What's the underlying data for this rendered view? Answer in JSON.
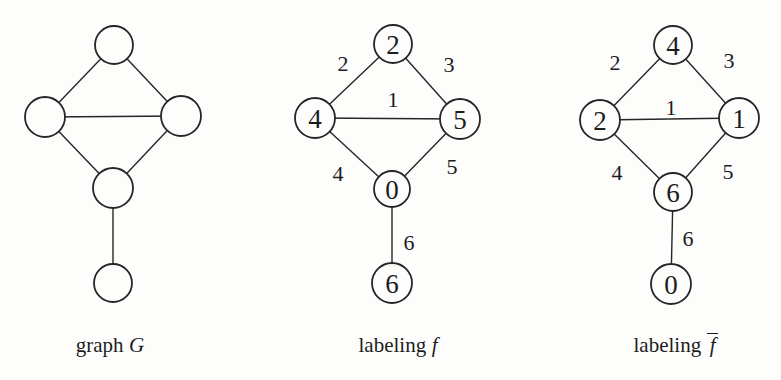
{
  "page": {
    "background": "#fdfdfc",
    "ink": "#262626"
  },
  "diagrams": [
    {
      "id": "graph-g",
      "caption": {
        "prefix": "graph",
        "symbol": "G",
        "overline": false
      },
      "nodes": [
        {
          "id": "top",
          "x": 114,
          "y": 45,
          "r": 19,
          "label": ""
        },
        {
          "id": "left",
          "x": 45,
          "y": 117,
          "r": 20,
          "label": ""
        },
        {
          "id": "right",
          "x": 181,
          "y": 116,
          "r": 20,
          "label": ""
        },
        {
          "id": "bottom",
          "x": 113,
          "y": 188,
          "r": 20,
          "label": ""
        },
        {
          "id": "pendant",
          "x": 113,
          "y": 283,
          "r": 19,
          "label": ""
        }
      ],
      "edges": [
        {
          "from": "left",
          "to": "top",
          "label": "",
          "lx": 0,
          "ly": 0
        },
        {
          "from": "top",
          "to": "right",
          "label": "",
          "lx": 0,
          "ly": 0
        },
        {
          "from": "left",
          "to": "right",
          "label": "",
          "lx": 0,
          "ly": 0
        },
        {
          "from": "left",
          "to": "bottom",
          "label": "",
          "lx": 0,
          "ly": 0
        },
        {
          "from": "right",
          "to": "bottom",
          "label": "",
          "lx": 0,
          "ly": 0
        },
        {
          "from": "bottom",
          "to": "pendant",
          "label": "",
          "lx": 0,
          "ly": 0
        }
      ]
    },
    {
      "id": "labeling-f",
      "caption": {
        "prefix": "labeling",
        "symbol": "f",
        "overline": false
      },
      "nodes": [
        {
          "id": "top",
          "x": 393,
          "y": 44,
          "r": 19,
          "label": "2"
        },
        {
          "id": "left",
          "x": 315,
          "y": 118,
          "r": 20,
          "label": "4"
        },
        {
          "id": "right",
          "x": 460,
          "y": 119,
          "r": 20,
          "label": "5"
        },
        {
          "id": "bottom",
          "x": 392,
          "y": 189,
          "r": 18,
          "label": "0"
        },
        {
          "id": "pendant",
          "x": 392,
          "y": 283,
          "r": 20,
          "label": "6"
        }
      ],
      "edges": [
        {
          "from": "left",
          "to": "top",
          "label": "2",
          "lx": 343,
          "ly": 63
        },
        {
          "from": "top",
          "to": "right",
          "label": "3",
          "lx": 449,
          "ly": 64
        },
        {
          "from": "left",
          "to": "right",
          "label": "1",
          "lx": 393,
          "ly": 99
        },
        {
          "from": "left",
          "to": "bottom",
          "label": "4",
          "lx": 338,
          "ly": 173
        },
        {
          "from": "right",
          "to": "bottom",
          "label": "5",
          "lx": 452,
          "ly": 166
        },
        {
          "from": "bottom",
          "to": "pendant",
          "label": "6",
          "lx": 409,
          "ly": 242
        }
      ]
    },
    {
      "id": "labeling-f-bar",
      "caption": {
        "prefix": "labeling",
        "symbol": "f",
        "overline": true
      },
      "nodes": [
        {
          "id": "top",
          "x": 673,
          "y": 45,
          "r": 19,
          "label": "4"
        },
        {
          "id": "left",
          "x": 600,
          "y": 120,
          "r": 20,
          "label": "2"
        },
        {
          "id": "right",
          "x": 739,
          "y": 118,
          "r": 20,
          "label": "1"
        },
        {
          "id": "bottom",
          "x": 673,
          "y": 192,
          "r": 19,
          "label": "6"
        },
        {
          "id": "pendant",
          "x": 671,
          "y": 284,
          "r": 20,
          "label": "0"
        }
      ],
      "edges": [
        {
          "from": "left",
          "to": "top",
          "label": "2",
          "lx": 615,
          "ly": 62
        },
        {
          "from": "top",
          "to": "right",
          "label": "3",
          "lx": 729,
          "ly": 60
        },
        {
          "from": "left",
          "to": "right",
          "label": "1",
          "lx": 671,
          "ly": 107
        },
        {
          "from": "left",
          "to": "bottom",
          "label": "4",
          "lx": 617,
          "ly": 172
        },
        {
          "from": "right",
          "to": "bottom",
          "label": "5",
          "lx": 728,
          "ly": 171
        },
        {
          "from": "bottom",
          "to": "pendant",
          "label": "6",
          "lx": 688,
          "ly": 238
        }
      ]
    }
  ]
}
